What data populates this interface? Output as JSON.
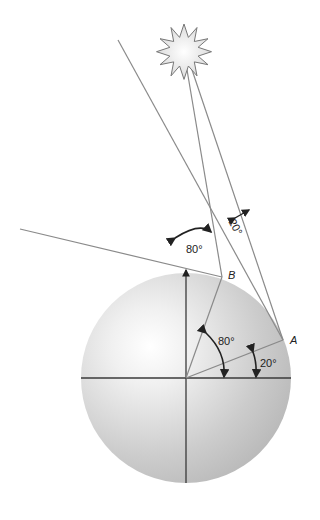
{
  "diagram": {
    "type": "geometry-illustration",
    "points": [
      {
        "id": "A",
        "label": "A"
      },
      {
        "id": "B",
        "label": "B"
      }
    ],
    "angles": {
      "tangent_at_top": "80°",
      "between_rays": "20°",
      "central_to_B": "80°",
      "central_to_A": "20°"
    },
    "colors": {
      "sphere_light": "#ffffff",
      "sphere_dark": "#bdbdbd",
      "line": "#8a8a8a",
      "axis": "#3a3a3a",
      "arrow": "#222222",
      "sun_fill": "#f2f2f2",
      "sun_stroke": "#777777"
    }
  }
}
